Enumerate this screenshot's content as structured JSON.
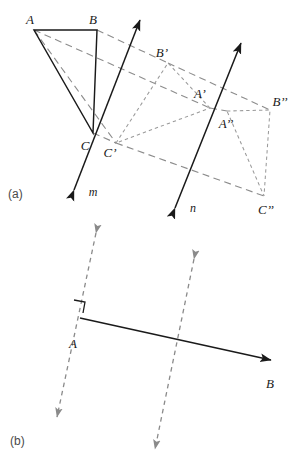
{
  "figure": {
    "colors": {
      "solid_stroke": "#1a1a1a",
      "connector_dash": "#8c8c8c",
      "image_dash": "#9a9a9a",
      "label_text": "#1a1a1a",
      "part_label_text": "#4a4a4a",
      "background": "#ffffff"
    },
    "parts": [
      {
        "key": "a",
        "label": "(a)",
        "x": 14,
        "y": 194
      },
      {
        "key": "b",
        "label": "(b)",
        "x": 16,
        "y": 441
      }
    ],
    "panel_a": {
      "mirror_lines": [
        {
          "name": "m",
          "label": "m",
          "label_x": 93,
          "label_y": 192,
          "x1": 74,
          "y1": 190,
          "x2": 140,
          "y2": 20
        },
        {
          "name": "n",
          "label": "n",
          "label_x": 192,
          "label_y": 208,
          "x1": 175,
          "y1": 208,
          "x2": 241,
          "y2": 43
        }
      ],
      "triangles": [
        {
          "name": "original",
          "style": "solid",
          "vertices": [
            {
              "id": "A",
              "label": "A",
              "x": 34,
              "y": 30,
              "label_x": 30,
              "label_y": 24
            },
            {
              "id": "B",
              "label": "B",
              "x": 97,
              "y": 30,
              "label_x": 93,
              "label_y": 24
            },
            {
              "id": "C",
              "label": "C",
              "x": 93,
              "y": 133,
              "label_x": 85,
              "label_y": 150
            }
          ]
        },
        {
          "name": "first-image",
          "style": "dashed",
          "vertices": [
            {
              "id": "A'",
              "label": "A’",
              "x": 210,
              "y": 108,
              "label_x": 200,
              "label_y": 98
            },
            {
              "id": "B'",
              "label": "B’",
              "x": 168,
              "y": 63,
              "label_x": 160,
              "label_y": 57
            },
            {
              "id": "C'",
              "label": "C’",
              "x": 116,
              "y": 143,
              "label_x": 110,
              "label_y": 157
            }
          ]
        },
        {
          "name": "second-image",
          "style": "dashed",
          "vertices": [
            {
              "id": "A''",
              "label": "A’’",
              "x": 227,
              "y": 111,
              "label_x": 223,
              "label_y": 126
            },
            {
              "id": "B''",
              "label": "B’’",
              "x": 270,
              "y": 110,
              "label_x": 275,
              "label_y": 106
            },
            {
              "id": "C''",
              "label": "C’’",
              "x": 264,
              "y": 196,
              "label_x": 259,
              "label_y": 213
            }
          ]
        }
      ],
      "connectors": [
        {
          "name": "A-to-A'",
          "x1": 34,
          "y1": 30,
          "x2": 210,
          "y2": 108
        },
        {
          "name": "B-to-B'",
          "x1": 97,
          "y1": 30,
          "x2": 168,
          "y2": 63
        },
        {
          "name": "C-to-C'",
          "x1": 93,
          "y1": 133,
          "x2": 116,
          "y2": 143
        },
        {
          "name": "A'-to-A''",
          "x1": 210,
          "y1": 108,
          "x2": 227,
          "y2": 111
        },
        {
          "name": "B'-to-B''",
          "x1": 168,
          "y1": 63,
          "x2": 270,
          "y2": 110
        },
        {
          "name": "C'-to-C''",
          "x1": 116,
          "y1": 143,
          "x2": 264,
          "y2": 196
        },
        {
          "name": "A-to-C'-guide",
          "x1": 34,
          "y1": 30,
          "x2": 116,
          "y2": 143
        }
      ]
    },
    "panel_b": {
      "parallel_lines": [
        {
          "name": "left-parallel-line",
          "x1": 96,
          "y1": 233,
          "x2": 57,
          "y2": 417
        },
        {
          "name": "right-parallel-line",
          "x1": 194,
          "y1": 259,
          "x2": 155,
          "y2": 449
        }
      ],
      "ray": {
        "name": "ray-AB",
        "x1": 80,
        "y1": 318,
        "x2": 271,
        "y2": 360,
        "start_label": "A",
        "start_label_x": 73,
        "start_label_y": 348,
        "end_label": "B",
        "end_label_x": 268,
        "end_label_y": 387
      },
      "right_angle": {
        "name": "right-angle-marker",
        "x": 74,
        "y": 301,
        "size": 11
      }
    }
  }
}
